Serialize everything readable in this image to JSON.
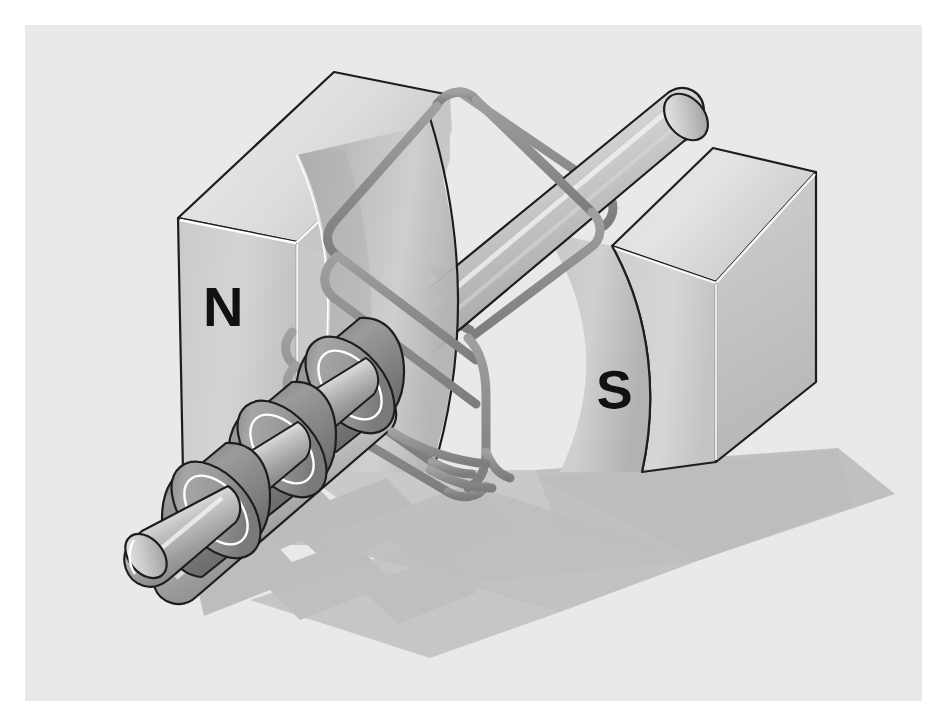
{
  "figure": {
    "kind": "technical-illustration",
    "canvas": {
      "width": 950,
      "height": 727,
      "page_background": "#ffffff",
      "plate_background": "#e9e9e9",
      "plate_inset_px": 25
    }
  },
  "labels": {
    "north_pole": "N",
    "south_pole": "S"
  },
  "colors": {
    "background": "#e9e9e9",
    "page": "#ffffff",
    "magnet_front_face": "#cfcfcf",
    "magnet_top_face": "#dadada",
    "magnet_side_face": "#c2c2c2",
    "magnet_pole_cavity": "#b9b9b9",
    "outline": "#1a1a1a",
    "highlight": "#ffffff",
    "shaft_light": "#e4e4e4",
    "shaft_mid": "#b4b4b4",
    "shaft_dark": "#8f8f8f",
    "ring_dark": "#8c8c8c",
    "ring_face": "#a3a3a3",
    "coil_wire": "#919191",
    "shadow": "#b9b9b9",
    "label_text": "#111111"
  },
  "parts": [
    {
      "id": "magnet-north",
      "name": "North pole magnet block",
      "label": "N",
      "position": "left",
      "shape": "rectangular block with concave cylindrical pole face"
    },
    {
      "id": "magnet-south",
      "name": "South pole magnet block",
      "label": "S",
      "position": "right",
      "shape": "rectangular block with concave cylindrical pole face"
    },
    {
      "id": "armature-shaft",
      "name": "Armature shaft / rotor axle",
      "orientation": "diagonal, lower-left to upper-right"
    },
    {
      "id": "coil-winding",
      "name": "Wire coil loop (armature winding)",
      "turns": 2
    },
    {
      "id": "slip-ring-1",
      "name": "Slip ring disc nearest shaft end"
    },
    {
      "id": "slip-ring-2",
      "name": "Slip ring disc middle"
    },
    {
      "id": "slip-ring-3",
      "name": "Slip ring disc inner"
    },
    {
      "id": "ground-shadow",
      "name": "Cast shadow on ground plane"
    }
  ],
  "geometry": {
    "shaft_angle_deg": -28,
    "shaft_end_upper_right": [
      700,
      108
    ],
    "shaft_end_lower_left": [
      152,
      548
    ],
    "ring_count": 3,
    "coil_loop_count": 2
  }
}
